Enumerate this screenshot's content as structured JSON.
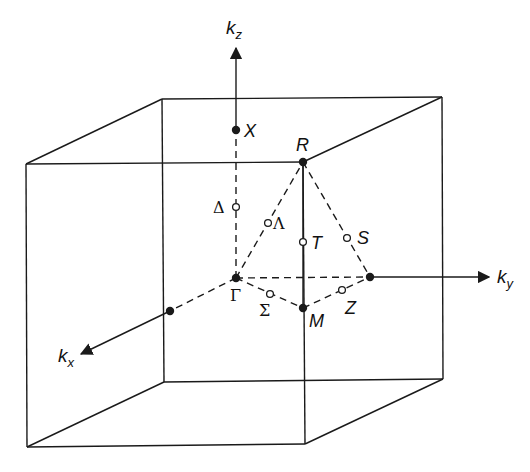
{
  "diagram": {
    "colors": {
      "line": "#1a1a1a",
      "background": "#ffffff"
    },
    "axes": {
      "kz": {
        "label": "k",
        "subscript": "z"
      },
      "ky": {
        "label": "k",
        "subscript": "y"
      },
      "kx": {
        "label": "k",
        "subscript": "x"
      }
    },
    "high_symmetry_points": [
      {
        "id": "Gamma",
        "label": "Γ",
        "type": "filled"
      },
      {
        "id": "X",
        "label": "X",
        "type": "filled"
      },
      {
        "id": "R",
        "label": "R",
        "type": "filled"
      },
      {
        "id": "M",
        "label": "M",
        "type": "filled"
      }
    ],
    "symmetry_lines": [
      {
        "id": "Delta",
        "label": "Δ",
        "type": "open"
      },
      {
        "id": "Lambda",
        "label": "Λ",
        "type": "open"
      },
      {
        "id": "T",
        "label": "T",
        "type": "open"
      },
      {
        "id": "S",
        "label": "S",
        "type": "open"
      },
      {
        "id": "Sigma",
        "label": "Σ",
        "type": "open"
      },
      {
        "id": "Z",
        "label": "Z",
        "type": "open"
      }
    ]
  }
}
